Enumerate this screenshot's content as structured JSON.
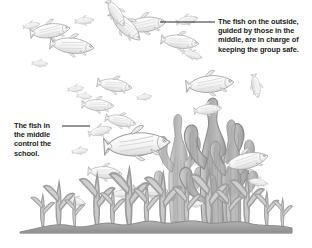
{
  "figure": {
    "style": "pencil-sketch grey line drawing",
    "background_color": "#ffffff",
    "ink_color": "#9a9a9a",
    "text_color": "#1c1c1c",
    "seafloor_color": "#a6a6a6"
  },
  "callouts": [
    {
      "id": "outside",
      "text": "The fish on the outside,\nguided by those in the\nmiddle, are in charge of\nkeeping the group safe.",
      "line": {
        "x1": 160,
        "y1": 22,
        "x2": 215,
        "y2": 22
      }
    },
    {
      "id": "middle",
      "text": "The fish in\nthe middle\ncontrol the\nschool.",
      "line": {
        "x1": 62,
        "y1": 126,
        "x2": 90,
        "y2": 126
      }
    }
  ],
  "scene": {
    "fish": [
      {
        "name": "fish-upper-left-large",
        "cx": 50,
        "cy": 28,
        "len": 38,
        "h": 13,
        "dir": 1,
        "rot": -8
      },
      {
        "name": "fish-upper-left-small",
        "cx": 30,
        "cy": 24,
        "len": 16,
        "h": 6,
        "dir": 1,
        "rot": -10
      },
      {
        "name": "fish-upper-mid-a",
        "cx": 70,
        "cy": 45,
        "len": 42,
        "h": 14,
        "dir": 1,
        "rot": 5
      },
      {
        "name": "fish-tiny-left",
        "cx": 38,
        "cy": 63,
        "len": 15,
        "h": 6,
        "dir": 1,
        "rot": 2
      },
      {
        "name": "fish-upper-right-a",
        "cx": 82,
        "cy": 22,
        "len": 17,
        "h": 7,
        "dir": 1,
        "rot": -4
      },
      {
        "name": "fish-top-center",
        "cx": 143,
        "cy": 22,
        "len": 40,
        "h": 14,
        "dir": 1,
        "rot": -6
      },
      {
        "name": "fish-top-center-b",
        "cx": 175,
        "cy": 40,
        "len": 36,
        "h": 13,
        "dir": 1,
        "rot": 6
      },
      {
        "name": "fish-mid-upper-diag",
        "cx": 126,
        "cy": 55,
        "len": 40,
        "h": 14,
        "dir": 1,
        "rot": 42
      },
      {
        "name": "fish-mid-upper-diag-b",
        "cx": 113,
        "cy": 40,
        "len": 30,
        "h": 11,
        "dir": 1,
        "rot": 55
      },
      {
        "name": "fish-center-right",
        "cx": 210,
        "cy": 82,
        "len": 46,
        "h": 16,
        "dir": 1,
        "rot": -4
      },
      {
        "name": "fish-center-a",
        "cx": 114,
        "cy": 88,
        "len": 34,
        "h": 12,
        "dir": 1,
        "rot": 8
      },
      {
        "name": "fish-center-b",
        "cx": 98,
        "cy": 105,
        "len": 30,
        "h": 13,
        "dir": 1,
        "rot": 3
      },
      {
        "name": "fish-small-left-a",
        "cx": 75,
        "cy": 88,
        "len": 15,
        "h": 6,
        "dir": 1,
        "rot": -5
      },
      {
        "name": "fish-small-left-b",
        "cx": 84,
        "cy": 96,
        "len": 14,
        "h": 6,
        "dir": 1,
        "rot": 4
      },
      {
        "name": "fish-label-target-middle",
        "cx": 100,
        "cy": 128,
        "len": 22,
        "h": 9,
        "dir": 1,
        "rot": -12
      },
      {
        "name": "fish-big-center",
        "cx": 136,
        "cy": 140,
        "len": 64,
        "h": 22,
        "dir": 1,
        "rot": -3
      },
      {
        "name": "fish-behind-big",
        "cx": 120,
        "cy": 126,
        "len": 30,
        "h": 11,
        "dir": 1,
        "rot": 10
      },
      {
        "name": "fish-right-upper",
        "cx": 208,
        "cy": 108,
        "len": 26,
        "h": 11,
        "dir": 1,
        "rot": -6
      },
      {
        "name": "fish-right-vert",
        "cx": 253,
        "cy": 108,
        "len": 22,
        "h": 8,
        "dir": 1,
        "rot": 78
      },
      {
        "name": "fish-right-lower",
        "cx": 246,
        "cy": 154,
        "len": 42,
        "h": 15,
        "dir": 1,
        "rot": -12
      },
      {
        "name": "fish-right-small",
        "cx": 258,
        "cy": 183,
        "len": 18,
        "h": 7,
        "dir": 1,
        "rot": 10
      },
      {
        "name": "fish-lower-left",
        "cx": 106,
        "cy": 172,
        "len": 32,
        "h": 12,
        "dir": 1,
        "rot": 4
      },
      {
        "name": "fish-lower-left-small",
        "cx": 78,
        "cy": 150,
        "len": 15,
        "h": 6,
        "dir": 1,
        "rot": -6
      },
      {
        "name": "fish-lower-center",
        "cx": 150,
        "cy": 190,
        "len": 34,
        "h": 12,
        "dir": 1,
        "rot": 2
      },
      {
        "name": "fish-lower-center-b",
        "cx": 122,
        "cy": 192,
        "len": 18,
        "h": 7,
        "dir": 1,
        "rot": -3
      },
      {
        "name": "fish-bottom-left",
        "cx": 76,
        "cy": 202,
        "len": 20,
        "h": 8,
        "dir": 1,
        "rot": 14
      },
      {
        "name": "fish-bottom-tiny",
        "cx": 196,
        "cy": 202,
        "len": 16,
        "h": 6,
        "dir": 1,
        "rot": -5
      },
      {
        "name": "fish-upper-far-right",
        "cx": 193,
        "cy": 62,
        "len": 18,
        "h": 7,
        "dir": 1,
        "rot": 16
      },
      {
        "name": "fish-mid-right-small",
        "cx": 145,
        "cy": 96,
        "len": 14,
        "h": 6,
        "dir": 1,
        "rot": -8
      },
      {
        "name": "fish-stack-right",
        "cx": 186,
        "cy": 18,
        "len": 20,
        "h": 8,
        "dir": 1,
        "rot": -12
      }
    ],
    "coral": [
      {
        "name": "coral-main-trunk",
        "x": 176,
        "y": 88,
        "w": 30,
        "h": 140
      },
      {
        "name": "coral-left-branch",
        "x": 150,
        "y": 100,
        "w": 22,
        "h": 128
      },
      {
        "name": "coral-right-branch",
        "x": 200,
        "y": 110,
        "w": 24,
        "h": 118
      }
    ],
    "seaweed_count": 14,
    "seafloor": {
      "y": 226,
      "x1": 18,
      "x2": 294
    }
  }
}
